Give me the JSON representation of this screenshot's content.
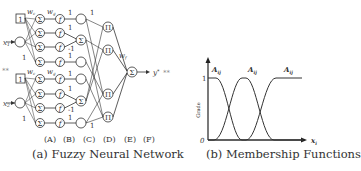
{
  "left_panel": {
    "caption": "(a) Fuzzy Neural Network",
    "layer_labels": [
      "(A)",
      "(B)",
      "(C)",
      "(D)",
      "(E)",
      "(F)"
    ],
    "inputs": [
      "x1",
      "x2"
    ],
    "bias_label": "1",
    "sum_symbol": "Σ",
    "func_symbol": "f",
    "prod_symbol": "Π",
    "weights": {
      "wc": "wc",
      "wg": "wg",
      "wf": "wf"
    },
    "edge_values": [
      "1",
      "1",
      "1",
      "-1",
      "1",
      "1"
    ],
    "output_label": "y*",
    "stray_marks": [
      "**",
      "**"
    ]
  },
  "right_panel": {
    "caption": "(b) Membership Functions",
    "y_axis_label": "Grade",
    "y_ticks": [
      "0",
      "1"
    ],
    "x_axis_label": "xi",
    "curve_labels": [
      "Aij",
      "Aij",
      "Aij"
    ]
  }
}
